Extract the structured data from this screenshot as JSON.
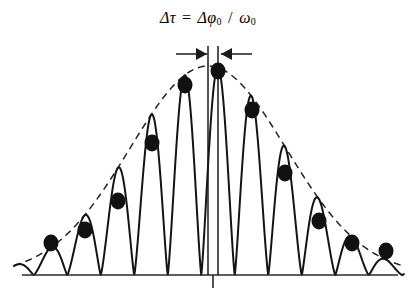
{
  "figure": {
    "title_plain": "Δτ = Δφ₀ / ω₀",
    "title_parts": {
      "delta1": "Δ",
      "tau": "τ",
      "equals": "=",
      "delta2": "Δ",
      "phi": "φ",
      "phi_sub": "0",
      "slash": "/",
      "omega": "ω",
      "omega_sub": "0"
    },
    "colors": {
      "ink": "#1a1a1a",
      "curve": "#141414",
      "dashed_envelope": "#242424",
      "axis": "#2b2b2b",
      "background": "#ffffff",
      "marker_fill": "#111111"
    },
    "annotation": {
      "name": "delta-tau-dimension",
      "label": "Δτ",
      "arrow_style": "inward-arrowheads",
      "left_arrow_tip_x": 207,
      "right_arrow_tip_x": 221,
      "leader_left_x": 176,
      "leader_right_x": 252,
      "y": 54
    },
    "axis": {
      "baseline_y": 275,
      "baseline_x0": 22,
      "baseline_x1": 398,
      "center_tick_x": 213,
      "center_tick_y0": 275,
      "center_tick_y1": 288
    },
    "vertical_lines": [
      {
        "name": "envelope-peak-line",
        "x": 208,
        "y0": 46,
        "y1": 275
      },
      {
        "name": "carrier-peak-line",
        "x": 218,
        "y0": 46,
        "y1": 275
      }
    ]
  },
  "chart_data": {
    "type": "line",
    "xlabel": "",
    "ylabel": "",
    "grid": false,
    "legend": "none",
    "xlim": [
      0,
      416
    ],
    "ylim": [
      275,
      60
    ],
    "series": [
      {
        "name": "oscillation",
        "style": "solid",
        "note": "rectified carrier |cos| modulated by gaussian envelope",
        "carrier_period_px": 33.5,
        "carrier_peak_x": 218,
        "envelope_center_x": 208,
        "envelope_sigma_px": 78,
        "envelope_peak_y": 66,
        "baseline_y": 275
      },
      {
        "name": "envelope",
        "style": "dashed",
        "note": "gaussian envelope through the peak markers"
      }
    ],
    "markers": [
      {
        "i": 1,
        "x": 51,
        "y": 243
      },
      {
        "i": 2,
        "x": 85,
        "y": 230
      },
      {
        "i": 3,
        "x": 118,
        "y": 201
      },
      {
        "i": 4,
        "x": 152,
        "y": 143
      },
      {
        "i": 5,
        "x": 185,
        "y": 85
      },
      {
        "i": 6,
        "x": 218,
        "y": 71
      },
      {
        "i": 7,
        "x": 252,
        "y": 110
      },
      {
        "i": 8,
        "x": 285,
        "y": 173
      },
      {
        "i": 9,
        "x": 319,
        "y": 221
      },
      {
        "i": 10,
        "x": 352,
        "y": 243
      },
      {
        "i": 11,
        "x": 386,
        "y": 251
      }
    ],
    "marker_radius_px": 7.5,
    "marker_style": "filled-circle"
  }
}
